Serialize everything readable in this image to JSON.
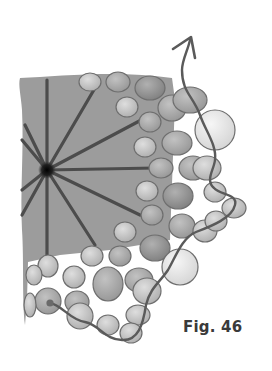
{
  "figure": {
    "label": "Fig. 46",
    "colors": {
      "base_fill": "#9a9a9a",
      "spoke": "#4a4a4a",
      "center": "#111111",
      "bead_dark": "#8d8d8d",
      "bead_mid": "#a9a9a9",
      "bead_light": "#c4c4c4",
      "bead_pale": "#e6e6e6",
      "bead_outline": "#6e6e6e",
      "thread": "#5a5a5a",
      "label": "#3a3a3a"
    },
    "center": {
      "x": 47,
      "y": 170
    },
    "spokes": [
      {
        "x2": 47,
        "y2": 80
      },
      {
        "x2": 95,
        "y2": 88
      },
      {
        "x2": 145,
        "y2": 118
      },
      {
        "x2": 155,
        "y2": 168
      },
      {
        "x2": 140,
        "y2": 215
      },
      {
        "x2": 95,
        "y2": 245
      },
      {
        "x2": 47,
        "y2": 255
      },
      {
        "x2": 22,
        "y2": 215
      },
      {
        "x2": 22,
        "y2": 190
      },
      {
        "x2": 22,
        "y2": 140
      },
      {
        "x2": 25,
        "y2": 125
      }
    ],
    "beads": [
      {
        "cx": 90,
        "cy": 82,
        "rx": 11,
        "ry": 9,
        "tone": "light"
      },
      {
        "cx": 118,
        "cy": 82,
        "rx": 12,
        "ry": 10,
        "tone": "mid"
      },
      {
        "cx": 150,
        "cy": 88,
        "rx": 15,
        "ry": 12,
        "tone": "dark"
      },
      {
        "cx": 127,
        "cy": 107,
        "rx": 11,
        "ry": 10,
        "tone": "light"
      },
      {
        "cx": 150,
        "cy": 122,
        "rx": 11,
        "ry": 10,
        "tone": "mid"
      },
      {
        "cx": 172,
        "cy": 108,
        "rx": 14,
        "ry": 13,
        "tone": "mid"
      },
      {
        "cx": 190,
        "cy": 100,
        "rx": 17,
        "ry": 13,
        "tone": "mid"
      },
      {
        "cx": 215,
        "cy": 130,
        "rx": 20,
        "ry": 20,
        "tone": "pale"
      },
      {
        "cx": 145,
        "cy": 147,
        "rx": 11,
        "ry": 10,
        "tone": "light"
      },
      {
        "cx": 177,
        "cy": 143,
        "rx": 15,
        "ry": 12,
        "tone": "mid"
      },
      {
        "cx": 161,
        "cy": 168,
        "rx": 12,
        "ry": 10,
        "tone": "mid"
      },
      {
        "cx": 193,
        "cy": 168,
        "rx": 14,
        "ry": 12,
        "tone": "mid"
      },
      {
        "cx": 207,
        "cy": 168,
        "rx": 14,
        "ry": 12,
        "tone": "light"
      },
      {
        "cx": 147,
        "cy": 191,
        "rx": 11,
        "ry": 10,
        "tone": "light"
      },
      {
        "cx": 178,
        "cy": 196,
        "rx": 15,
        "ry": 13,
        "tone": "dark"
      },
      {
        "cx": 215,
        "cy": 192,
        "rx": 11,
        "ry": 10,
        "tone": "light"
      },
      {
        "cx": 234,
        "cy": 208,
        "rx": 12,
        "ry": 10,
        "tone": "light"
      },
      {
        "cx": 152,
        "cy": 215,
        "rx": 11,
        "ry": 10,
        "tone": "mid"
      },
      {
        "cx": 182,
        "cy": 226,
        "rx": 13,
        "ry": 12,
        "tone": "mid"
      },
      {
        "cx": 205,
        "cy": 231,
        "rx": 12,
        "ry": 11,
        "tone": "light"
      },
      {
        "cx": 216,
        "cy": 221,
        "rx": 11,
        "ry": 10,
        "tone": "light"
      },
      {
        "cx": 125,
        "cy": 232,
        "rx": 11,
        "ry": 10,
        "tone": "light"
      },
      {
        "cx": 155,
        "cy": 248,
        "rx": 15,
        "ry": 13,
        "tone": "dark"
      },
      {
        "cx": 180,
        "cy": 267,
        "rx": 18,
        "ry": 18,
        "tone": "pale"
      },
      {
        "cx": 92,
        "cy": 256,
        "rx": 11,
        "ry": 10,
        "tone": "light"
      },
      {
        "cx": 120,
        "cy": 256,
        "rx": 11,
        "ry": 10,
        "tone": "mid"
      },
      {
        "cx": 48,
        "cy": 266,
        "rx": 10,
        "ry": 11,
        "tone": "light"
      },
      {
        "cx": 74,
        "cy": 277,
        "rx": 11,
        "ry": 11,
        "tone": "light"
      },
      {
        "cx": 108,
        "cy": 284,
        "rx": 15,
        "ry": 17,
        "tone": "mid"
      },
      {
        "cx": 139,
        "cy": 280,
        "rx": 14,
        "ry": 12,
        "tone": "mid"
      },
      {
        "cx": 147,
        "cy": 291,
        "rx": 14,
        "ry": 13,
        "tone": "light"
      },
      {
        "cx": 34,
        "cy": 275,
        "rx": 8,
        "ry": 10,
        "tone": "light"
      },
      {
        "cx": 48,
        "cy": 301,
        "rx": 13,
        "ry": 13,
        "tone": "mid"
      },
      {
        "cx": 77,
        "cy": 302,
        "rx": 12,
        "ry": 11,
        "tone": "mid"
      },
      {
        "cx": 80,
        "cy": 316,
        "rx": 13,
        "ry": 13,
        "tone": "light"
      },
      {
        "cx": 108,
        "cy": 325,
        "rx": 11,
        "ry": 10,
        "tone": "light"
      },
      {
        "cx": 138,
        "cy": 315,
        "rx": 12,
        "ry": 10,
        "tone": "light"
      },
      {
        "cx": 131,
        "cy": 333,
        "rx": 11,
        "ry": 10,
        "tone": "light"
      },
      {
        "cx": 30,
        "cy": 305,
        "rx": 6,
        "ry": 12,
        "tone": "light"
      }
    ],
    "thread_path": "M50,303 C62,305 70,320 85,322 C100,325 105,340 122,340 C138,341 143,325 146,305 C150,288 160,282 168,270 C176,256 182,238 196,232 C212,226 232,218 235,205 C238,194 220,195 214,188 C205,180 214,170 215,160 C217,145 205,130 200,115 C193,96 182,92 182,70 C182,60 188,50 190,40",
    "arrow": {
      "tip_x": 191,
      "tip_y": 37
    }
  }
}
